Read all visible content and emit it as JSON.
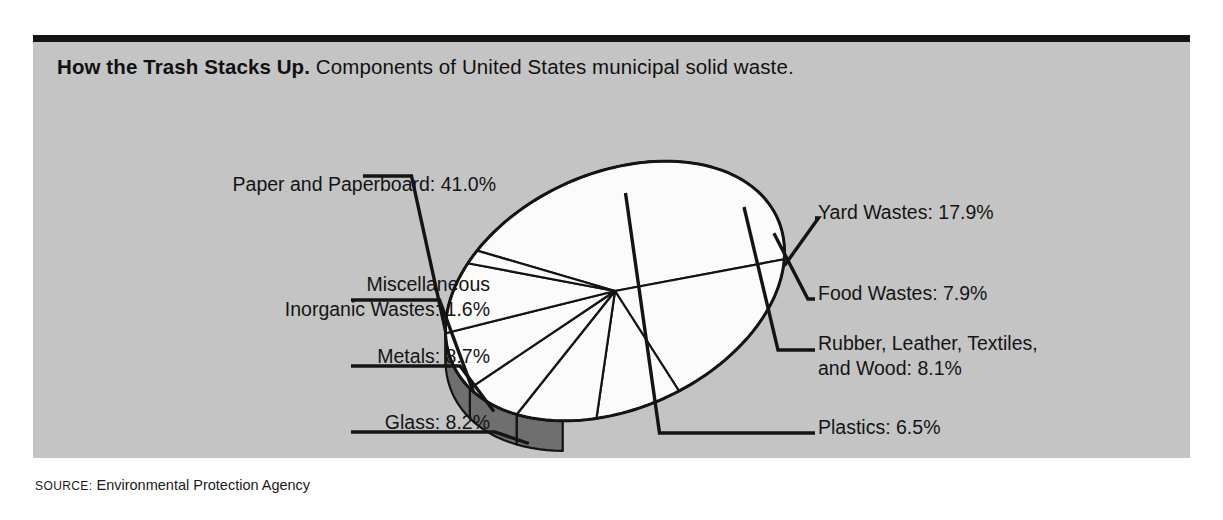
{
  "figure": {
    "headline_bold": "How the Trash Stacks Up.",
    "headline_rest": " Components of United States municipal solid waste.",
    "source_label": "SOURCE:",
    "source_value": " Environmental Protection Agency"
  },
  "colors": {
    "panel_background": "#c4c4c4",
    "page_background": "#ffffff",
    "rule": "#141414",
    "pie_top_face": "#fbfbfb",
    "pie_side_wall": "#6f6f6f",
    "outline": "#141414",
    "text": "#141414"
  },
  "chart_data": {
    "type": "pie",
    "title": "How the Trash Stacks Up.",
    "subtitle": "Components of United States municipal solid waste.",
    "source": "Environmental Protection Agency",
    "units": "percent of municipal solid waste",
    "style": "3d-exploded-tilted",
    "total": 99.9,
    "legend_position": "callouts",
    "categories": [
      "Paper and Paperboard",
      "Yard Wastes",
      "Metals",
      "Glass",
      "Rubber, Leather, Textiles, and Wood",
      "Food Wastes",
      "Plastics",
      "Miscellaneous Inorganic Wastes"
    ],
    "values": [
      41.0,
      17.9,
      8.7,
      8.2,
      8.1,
      7.9,
      6.5,
      1.6
    ],
    "slices": [
      {
        "label": "Paper and Paperboard",
        "value": 41.0,
        "display": "Paper and Paperboard: 41.0%"
      },
      {
        "label": "Yard Wastes",
        "value": 17.9,
        "display": "Yard Wastes: 17.9%"
      },
      {
        "label": "Food Wastes",
        "value": 7.9,
        "display": "Food Wastes: 7.9%"
      },
      {
        "label": "Rubber, Leather, Textiles, and Wood",
        "value": 8.1,
        "display": "Rubber, Leather, Textiles, and Wood: 8.1%"
      },
      {
        "label": "Plastics",
        "value": 6.5,
        "display": "Plastics: 6.5%"
      },
      {
        "label": "Glass",
        "value": 8.2,
        "display": "Glass: 8.2%"
      },
      {
        "label": "Metals",
        "value": 8.7,
        "display": "Metals: 8.7%"
      },
      {
        "label": "Miscellaneous Inorganic Wastes",
        "value": 1.6,
        "display": "Miscellaneous Inorganic Wastes: 1.6%"
      }
    ]
  },
  "callouts": {
    "paper": {
      "line1": "Paper and Paperboard: 41.0%"
    },
    "misc": {
      "line1": "Miscellaneous",
      "line2": "Inorganic Wastes: 1.6%"
    },
    "metals": {
      "line1": "Metals: 8.7%"
    },
    "glass": {
      "line1": "Glass: 8.2%"
    },
    "yard": {
      "line1": "Yard Wastes: 17.9%"
    },
    "food": {
      "line1": "Food Wastes: 7.9%"
    },
    "rubber": {
      "line1": "Rubber, Leather, Textiles,",
      "line2": "and Wood: 8.1%"
    },
    "plastics": {
      "line1": "Plastics: 6.5%"
    }
  }
}
